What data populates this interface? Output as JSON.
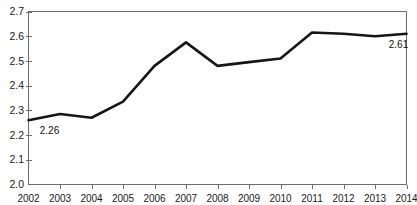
{
  "chart_data": {
    "type": "line",
    "title": "",
    "xlabel": "",
    "ylabel": "",
    "categories": [
      "2002",
      "2003",
      "2004",
      "2005",
      "2006",
      "2007",
      "2008",
      "2009",
      "2010",
      "2011",
      "2012",
      "2013",
      "2014"
    ],
    "values": [
      2.26,
      2.285,
      2.27,
      2.335,
      2.48,
      2.575,
      2.48,
      2.495,
      2.51,
      2.615,
      2.61,
      2.6,
      2.61
    ],
    "series": [
      {
        "name": "",
        "values": [
          2.26,
          2.285,
          2.27,
          2.335,
          2.48,
          2.575,
          2.48,
          2.495,
          2.51,
          2.615,
          2.61,
          2.6,
          2.61
        ]
      }
    ],
    "ylim": [
      2.0,
      2.7
    ],
    "yticks": [
      "2.0",
      "2.1",
      "2.2",
      "2.3",
      "2.4",
      "2.5",
      "2.6",
      "2.7"
    ],
    "ytick_values": [
      2.0,
      2.1,
      2.2,
      2.3,
      2.4,
      2.5,
      2.6,
      2.7
    ],
    "xticks": [
      "2002",
      "2003",
      "2004",
      "2005",
      "2006",
      "2007",
      "2008",
      "2009",
      "2010",
      "2011",
      "2012",
      "2013",
      "2014"
    ],
    "grid": false,
    "legend": "none",
    "line_color": "#161616",
    "axis_color": "#6e6e6e",
    "background": "#ffffff",
    "data_labels": [
      {
        "category": "2002",
        "value": 2.26,
        "text": "2.26"
      },
      {
        "category": "2014",
        "value": 2.61,
        "text": "2.61"
      }
    ],
    "annotations": []
  },
  "labels": {
    "first_point": "2.26",
    "last_point": "2.61"
  }
}
